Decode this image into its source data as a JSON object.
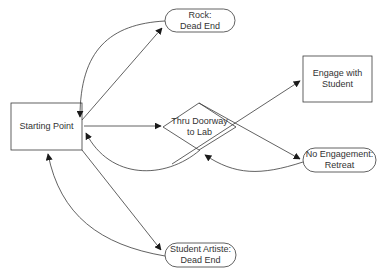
{
  "diagram": {
    "type": "flowchart",
    "colors": {
      "stroke": "#3a3a3a",
      "text": "#333333",
      "background": "#ffffff"
    },
    "nodes": [
      {
        "id": "start",
        "shape": "rectangle",
        "label": "Starting Point"
      },
      {
        "id": "rock",
        "shape": "terminator",
        "label": "Rock:\nDead End"
      },
      {
        "id": "doorway",
        "shape": "diamond",
        "label": "Thru Doorway\nto Lab"
      },
      {
        "id": "engage",
        "shape": "rectangle",
        "label": "Engage with\nStudent"
      },
      {
        "id": "retreat",
        "shape": "terminator",
        "label": "No Engagement:\nRetreat"
      },
      {
        "id": "artiste",
        "shape": "terminator",
        "label": "Student Artiste:\nDead End"
      }
    ],
    "edges": [
      {
        "from": "start",
        "to": "rock",
        "style": "straight"
      },
      {
        "from": "rock",
        "to": "start",
        "style": "curved"
      },
      {
        "from": "start",
        "to": "doorway",
        "style": "straight"
      },
      {
        "from": "doorway",
        "to": "engage",
        "style": "straight"
      },
      {
        "from": "doorway",
        "to": "retreat",
        "style": "straight"
      },
      {
        "from": "retreat",
        "to": "doorway",
        "style": "curved"
      },
      {
        "from": "doorway",
        "to": "start",
        "style": "curved"
      },
      {
        "from": "start",
        "to": "artiste",
        "style": "straight"
      },
      {
        "from": "artiste",
        "to": "start",
        "style": "curved"
      }
    ]
  }
}
